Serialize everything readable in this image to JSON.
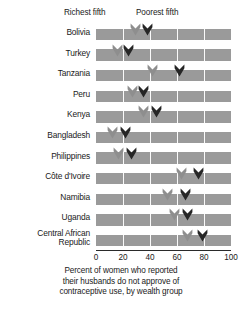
{
  "legend": {
    "richest_label": "Richest fifth",
    "poorest_label": "Poorest fifth",
    "richest_color": "#8e8e8e",
    "poorest_color": "#262626"
  },
  "axis": {
    "ticks": [
      "0",
      "20",
      "40",
      "60",
      "80",
      "100"
    ],
    "min": 0,
    "max": 100
  },
  "caption": {
    "line1": "Percent of women who reported",
    "line2": "their husbands do not approve of",
    "line3": "contraceptive use, by wealth group"
  },
  "chart_data": {
    "type": "bar",
    "title": "",
    "xlabel": "Percent of women who reported their husbands do not approve of contraceptive use, by wealth group",
    "ylabel": "",
    "xlim": [
      0,
      100
    ],
    "grid": true,
    "legend_position": "top",
    "orientation": "horizontal",
    "marker_style": "chevron",
    "categories": [
      "Bolivia",
      "Turkey",
      "Tanzania",
      "Peru",
      "Kenya",
      "Bangladesh",
      "Philippines",
      "Côte d'Ivoire",
      "Namibia",
      "Uganda",
      "Central African\nRepublic"
    ],
    "series": [
      {
        "name": "Richest fifth",
        "color": "#8e8e8e",
        "values": [
          29,
          16,
          42,
          27,
          35,
          12,
          17,
          63,
          53,
          58,
          68
        ]
      },
      {
        "name": "Poorest fifth",
        "color": "#262626",
        "values": [
          38,
          24,
          62,
          35,
          45,
          22,
          26,
          76,
          66,
          68,
          79
        ]
      }
    ],
    "bar_track_color": "#9a9a9a",
    "bar_track_max": 100
  }
}
